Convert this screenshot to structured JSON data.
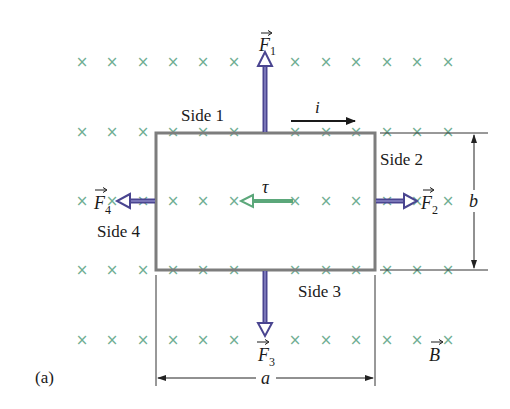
{
  "figure": {
    "panel_label": "(a)",
    "colors": {
      "field_mark": "#6fae92",
      "loop": "#7d7d7d",
      "force_arrow": "#4a4590",
      "force_arrow_light": "#8a86c4",
      "torque_arrow": "#5ba77a",
      "dimension": "#333333",
      "text": "#1a1a1a"
    },
    "field": {
      "symbol": "×",
      "label": "B",
      "rows_y": [
        62,
        132,
        201,
        270,
        340
      ],
      "cols_x": [
        82,
        112,
        143,
        173,
        203,
        234,
        295,
        326,
        356,
        387,
        417,
        448
      ]
    },
    "loop": {
      "x": 156,
      "y": 133,
      "width": 219,
      "height": 137,
      "sides": [
        {
          "id": "side1",
          "label": "Side 1"
        },
        {
          "id": "side2",
          "label": "Side 2"
        },
        {
          "id": "side3",
          "label": "Side 3"
        },
        {
          "id": "side4",
          "label": "Side 4"
        }
      ]
    },
    "current": {
      "label": "i"
    },
    "forces": [
      {
        "id": "F1",
        "symbol": "F",
        "subscript": "1",
        "direction": "up"
      },
      {
        "id": "F2",
        "symbol": "F",
        "subscript": "2",
        "direction": "right"
      },
      {
        "id": "F3",
        "symbol": "F",
        "subscript": "3",
        "direction": "down"
      },
      {
        "id": "F4",
        "symbol": "F",
        "subscript": "4",
        "direction": "left"
      }
    ],
    "torque": {
      "label": "τ",
      "direction": "left"
    },
    "dimensions": {
      "width_label": "a",
      "height_label": "b"
    }
  }
}
